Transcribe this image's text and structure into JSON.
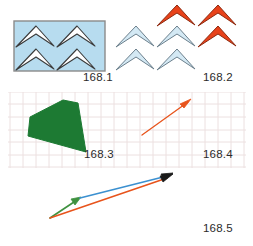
{
  "plate": {
    "title": "Figure plate 168.1-168.5",
    "background": "#ffffff",
    "width": 253,
    "height": 246
  },
  "labels": {
    "fig1": "168.1",
    "fig2": "168.2",
    "fig3": "168.3",
    "fig4": "168.4",
    "fig5": "168.5"
  },
  "colors": {
    "panel_fill": "#b7dcef",
    "panel_border": "#8a8a8a",
    "chevron_white": "#ffffff",
    "chevron_outline": "#3a3a3a",
    "chevron_light_blue_fill": "#d4e9f4",
    "chevron_light_blue_outline": "#6b7f8c",
    "chevron_orange_fill": "#e8421a",
    "chevron_orange_outline": "#8c2a10",
    "grid_line": "#e9dede",
    "polygon_green": "#1d7a33",
    "arrow_orange": "#e8541c",
    "arrow_blue": "#3b90d0",
    "arrow_green": "#3f9240",
    "arrow_dark": "#1a1a1a",
    "label_text": "#2b2b2b"
  },
  "figures": {
    "fig1": {
      "name": "blue-panel-with-white-chevrons",
      "description": "Light blue rectangular panel containing four white outlined chevrons arranged in two rows",
      "panel": {
        "x": 14,
        "y": 21,
        "width": 91,
        "height": 50
      },
      "chevron_count": 4
    },
    "fig2": {
      "name": "chevron-set-blue-and-orange",
      "description": "Four pale blue chevrons at lower left and three orange filled chevrons at upper right, clipped by image edge",
      "blue_chevron_count": 4,
      "orange_chevron_count": 3
    },
    "fig3": {
      "name": "green-polygon-on-grid",
      "description": "Solid dark green irregular quadrilateral drawn over a faint square grid",
      "polygon_vertices": [
        [
          30,
          117
        ],
        [
          63,
          100
        ],
        [
          78,
          103
        ],
        [
          86,
          152
        ],
        [
          28,
          136
        ]
      ]
    },
    "fig4": {
      "name": "single-orange-vector-arrow",
      "description": "Orange-red arrow pointing up and to the right over the faint grid",
      "start": [
        142,
        135
      ],
      "end": [
        190,
        101
      ]
    },
    "fig5": {
      "name": "vector-addition-triangle",
      "description": "Green vector plus blue vector giving orange resultant vector, all sharing a common tail and tip",
      "origin": [
        50,
        218
      ],
      "junction": [
        80,
        198
      ],
      "tip": [
        172,
        174
      ],
      "vectors": [
        {
          "name": "green-vector",
          "from": [
            50,
            218
          ],
          "to": [
            80,
            198
          ],
          "color": "#3f9240"
        },
        {
          "name": "blue-vector",
          "from": [
            80,
            198
          ],
          "to": [
            172,
            174
          ],
          "color": "#3b90d0"
        },
        {
          "name": "orange-resultant-vector",
          "from": [
            50,
            218
          ],
          "to": [
            172,
            174
          ],
          "color": "#e8541c"
        }
      ]
    }
  },
  "grid": {
    "name": "background-grid",
    "x": 8,
    "y": 92,
    "width": 238,
    "height": 76,
    "cell": 12.5
  }
}
